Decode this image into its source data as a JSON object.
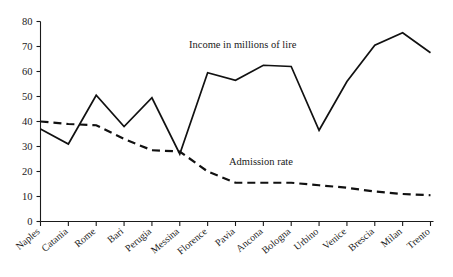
{
  "chart_data": {
    "type": "line",
    "title": "",
    "xlabel": "",
    "ylabel": "",
    "ylim": [
      0,
      80
    ],
    "ytick_step": 10,
    "grid": false,
    "legend_position": "inline-annotations",
    "categories": [
      "Naples",
      "Catania",
      "Rome",
      "Bari",
      "Perugia",
      "Messina",
      "Florence",
      "Pavia",
      "Ancona",
      "Bologna",
      "Urbino",
      "Venice",
      "Brescia",
      "Milan",
      "Trento"
    ],
    "ytick_labels": [
      "0",
      "10",
      "20",
      "30",
      "40",
      "50",
      "60",
      "70",
      "80"
    ],
    "series": [
      {
        "name": "Income in millions of lire",
        "style": "solid",
        "values": [
          37,
          31,
          50.5,
          38,
          49.5,
          27,
          59.5,
          56.5,
          62.5,
          62,
          36.5,
          56,
          70.5,
          75.5,
          67.5
        ]
      },
      {
        "name": "Admission rate",
        "style": "dashed",
        "values": [
          40,
          39,
          38.5,
          33,
          28.5,
          28,
          20,
          15.5,
          15.5,
          15.5,
          14.5,
          13.5,
          12,
          11,
          10.5
        ]
      }
    ],
    "annotations": [
      {
        "text": "Income in millions of lire",
        "x_px": 189,
        "y_px": 48
      },
      {
        "text": "Admission rate",
        "x_px": 229,
        "y_px": 165
      }
    ],
    "colors": {
      "series_line": "#111111",
      "axis": "#1a1a1a",
      "text": "#1a1a1a",
      "background": "#ffffff"
    }
  }
}
